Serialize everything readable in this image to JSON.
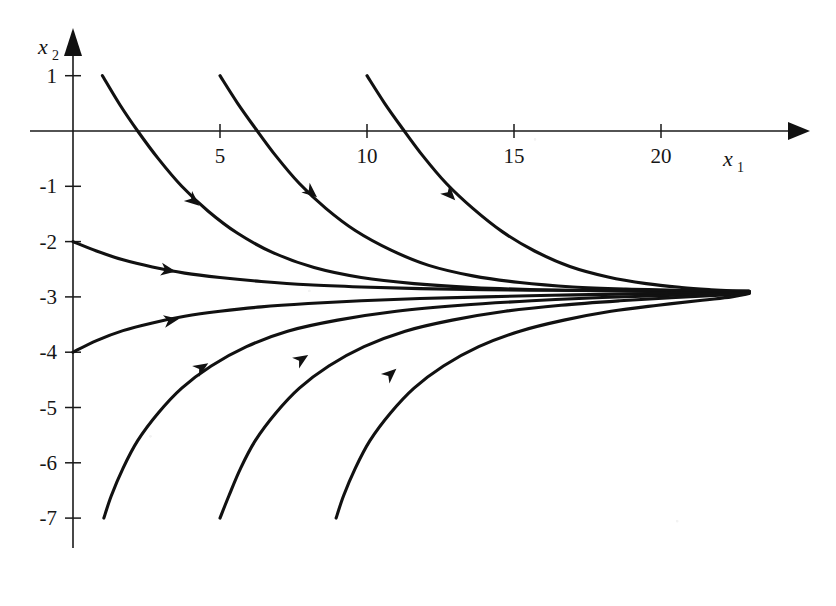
{
  "figure": {
    "title": "",
    "xlabel": "x",
    "xlabel_sub": "1",
    "ylabel": "x",
    "ylabel_sub": "2"
  },
  "chart_data": {
    "type": "line",
    "title": "",
    "subtitle": "",
    "xlabel": "x1",
    "ylabel": "x2",
    "xlim": [
      0,
      25
    ],
    "ylim": [
      -7.5,
      1.4
    ],
    "grid": false,
    "legend": null,
    "xticks": [
      5,
      10,
      15,
      20
    ],
    "xtick_labels": [
      "5",
      "10",
      "15",
      "20"
    ],
    "yticks": [
      1,
      -1,
      -2,
      -3,
      -4,
      -5,
      -6,
      -7
    ],
    "ytick_labels": [
      "1",
      "-1",
      "-2",
      "-3",
      "-4",
      "-5",
      "-6",
      "-7"
    ],
    "asymptote": -3,
    "annotations": [
      {
        "text": "trajectories converge to x2 = -3",
        "visible": false
      }
    ],
    "series": [
      {
        "name": "trajectory-1",
        "start": [
          1,
          1
        ],
        "end": [
          23,
          -2.9
        ],
        "arrow_at": [
          4.3,
          -1.35
        ],
        "points_x": [
          1.0,
          1.6,
          2.2,
          2.9,
          3.7,
          4.6,
          5.6,
          6.8,
          8.2,
          9.8,
          11.6,
          13.6,
          15.8,
          18.2,
          20.6,
          23.0
        ],
        "points_y": [
          1.0,
          0.47,
          0.0,
          -0.5,
          -1.0,
          -1.45,
          -1.85,
          -2.2,
          -2.47,
          -2.65,
          -2.76,
          -2.83,
          -2.87,
          -2.89,
          -2.9,
          -2.9
        ]
      },
      {
        "name": "trajectory-2",
        "start": [
          5,
          1
        ],
        "end": [
          23,
          -2.9
        ],
        "arrow_at": [
          8.3,
          -1.2
        ],
        "points_x": [
          5.0,
          5.6,
          6.2,
          6.9,
          7.7,
          8.6,
          9.6,
          10.8,
          12.1,
          13.6,
          15.2,
          17.0,
          18.8,
          20.5,
          22.0,
          23.0
        ],
        "points_y": [
          1.0,
          0.5,
          0.05,
          -0.45,
          -0.95,
          -1.4,
          -1.8,
          -2.15,
          -2.43,
          -2.62,
          -2.74,
          -2.82,
          -2.86,
          -2.88,
          -2.9,
          -2.9
        ]
      },
      {
        "name": "trajectory-3",
        "start": [
          10,
          1
        ],
        "end": [
          23,
          -2.9
        ],
        "arrow_at": [
          13.0,
          -1.25
        ],
        "points_x": [
          10.0,
          10.6,
          11.2,
          11.9,
          12.7,
          13.6,
          14.6,
          15.7,
          16.9,
          18.2,
          19.5,
          20.7,
          21.7,
          22.4,
          23.0
        ],
        "points_y": [
          1.0,
          0.5,
          0.05,
          -0.45,
          -0.95,
          -1.4,
          -1.82,
          -2.17,
          -2.45,
          -2.64,
          -2.76,
          -2.83,
          -2.87,
          -2.89,
          -2.9
        ]
      },
      {
        "name": "trajectory-4",
        "start": [
          0,
          -2
        ],
        "end": [
          23,
          -2.9
        ],
        "arrow_at": [
          3.5,
          -2.54
        ],
        "points_x": [
          0.0,
          0.8,
          1.7,
          2.7,
          3.8,
          5.0,
          6.4,
          8.0,
          9.8,
          11.8,
          14.0,
          16.3,
          18.6,
          20.8,
          23.0
        ],
        "points_y": [
          -2.0,
          -2.17,
          -2.33,
          -2.46,
          -2.57,
          -2.65,
          -2.72,
          -2.78,
          -2.82,
          -2.85,
          -2.87,
          -2.88,
          -2.89,
          -2.9,
          -2.9
        ]
      },
      {
        "name": "trajectory-5",
        "start": [
          0,
          -4
        ],
        "end": [
          23,
          -2.92
        ],
        "arrow_at": [
          3.6,
          -3.4
        ],
        "points_x": [
          0.0,
          0.8,
          1.7,
          2.7,
          3.8,
          5.0,
          6.4,
          8.0,
          9.8,
          11.8,
          14.0,
          16.3,
          18.6,
          20.8,
          23.0
        ],
        "points_y": [
          -4.0,
          -3.79,
          -3.61,
          -3.47,
          -3.35,
          -3.26,
          -3.18,
          -3.12,
          -3.07,
          -3.03,
          -3.0,
          -2.97,
          -2.95,
          -2.93,
          -2.92
        ]
      },
      {
        "name": "trajectory-6",
        "start": [
          1,
          -7
        ],
        "end": [
          23,
          -2.93
        ],
        "arrow_at": [
          4.6,
          -4.2
        ],
        "points_x": [
          1.05,
          1.3,
          1.7,
          2.2,
          2.9,
          3.7,
          4.7,
          5.9,
          7.3,
          9.0,
          11.0,
          13.2,
          15.6,
          18.0,
          20.5,
          23.0
        ],
        "points_y": [
          -7.0,
          -6.6,
          -6.1,
          -5.6,
          -5.1,
          -4.65,
          -4.25,
          -3.9,
          -3.62,
          -3.42,
          -3.26,
          -3.15,
          -3.07,
          -3.01,
          -2.97,
          -2.93
        ]
      },
      {
        "name": "trajectory-7",
        "start": [
          5,
          -7
        ],
        "end": [
          23,
          -2.93
        ],
        "arrow_at": [
          8.0,
          -4.05
        ],
        "points_x": [
          5.0,
          5.3,
          5.7,
          6.2,
          6.9,
          7.7,
          8.7,
          9.9,
          11.3,
          12.9,
          14.7,
          16.6,
          18.6,
          20.5,
          22.0,
          23.0
        ],
        "points_y": [
          -7.0,
          -6.6,
          -6.1,
          -5.6,
          -5.1,
          -4.65,
          -4.25,
          -3.9,
          -3.62,
          -3.42,
          -3.26,
          -3.15,
          -3.07,
          -3.01,
          -2.97,
          -2.93
        ]
      },
      {
        "name": "trajectory-8",
        "start": [
          9,
          -7
        ],
        "end": [
          23,
          -2.94
        ],
        "arrow_at": [
          11.0,
          -4.3
        ],
        "points_x": [
          8.95,
          9.2,
          9.6,
          10.1,
          10.8,
          11.6,
          12.6,
          13.8,
          15.2,
          16.7,
          18.3,
          19.9,
          21.4,
          22.4,
          23.0
        ],
        "points_y": [
          -7.0,
          -6.6,
          -6.1,
          -5.6,
          -5.1,
          -4.65,
          -4.25,
          -3.9,
          -3.62,
          -3.42,
          -3.26,
          -3.15,
          -3.06,
          -3.0,
          -2.94
        ]
      }
    ]
  },
  "axes": {
    "x_arrow_label": "x1 axis arrow",
    "y_arrow_label": "x2 axis arrow"
  }
}
